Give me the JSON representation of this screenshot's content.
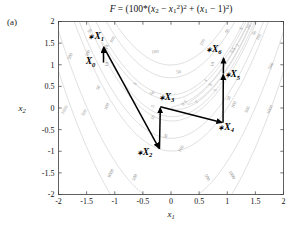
{
  "figure": {
    "panel_label": "(a)",
    "title_parts": {
      "f": "F",
      "eq": " = (100*(",
      "x2": "x",
      "x2sub": "2",
      "minus": " − ",
      "x1": "x",
      "x1sub": "1",
      "sq": "2",
      "close1": ")",
      "sq2": "2",
      "plus": " + (",
      "x1b": "x",
      "x1bsub": "1",
      "minus1": " − 1)",
      "sq3": "2",
      "close2": ")"
    },
    "xlabel": "x",
    "xlabel_sub": "1",
    "ylabel": "x",
    "ylabel_sub": "2"
  },
  "chart_data": {
    "type": "line",
    "xlabel": "x1",
    "ylabel": "x2",
    "xlim": [
      -2,
      2
    ],
    "ylim": [
      -2,
      2
    ],
    "grid": false,
    "xticks": [
      "-2",
      "-1.5",
      "-1",
      "-0.5",
      "0",
      "0.5",
      "1",
      "1.5",
      "2"
    ],
    "xtick_values": [
      -2,
      -1.5,
      -1,
      -0.5,
      0,
      0.5,
      1,
      1.5,
      2
    ],
    "yticks": [
      "-2",
      "-1.5",
      "-1",
      "-0.5",
      "0",
      "0.5",
      "1",
      "1.5",
      "2"
    ],
    "ytick_values": [
      -2,
      -1.5,
      -1,
      -0.5,
      0,
      0.5,
      1,
      1.5,
      2
    ],
    "contour_levels": [
      0.5,
      1,
      5,
      10,
      50,
      100,
      500,
      1000
    ],
    "function": "Rosenbrock",
    "series": [
      {
        "name": "search-path",
        "points": [
          {
            "label": "X0",
            "x": -1.2,
            "y": 1.05
          },
          {
            "label": "X1",
            "x": -1.2,
            "y": 1.42
          },
          {
            "label": "X2",
            "x": -0.205,
            "y": -0.95
          },
          {
            "label": "X3",
            "x": -0.19,
            "y": 0.03
          },
          {
            "label": "X4",
            "x": 0.925,
            "y": -0.34
          },
          {
            "label": "X5",
            "x": 0.93,
            "y": 0.8
          },
          {
            "label": "X6",
            "x": 0.935,
            "y": 1.18
          }
        ]
      }
    ],
    "point_labels": [
      {
        "text": "X",
        "sub": "0",
        "star": false,
        "x": -1.43,
        "y": 1.01
      },
      {
        "text": "X",
        "sub": "1",
        "star": true,
        "x": -1.33,
        "y": 1.6
      },
      {
        "text": "X",
        "sub": "2",
        "star": true,
        "x": -0.47,
        "y": -1.08
      },
      {
        "text": "X",
        "sub": "3",
        "star": true,
        "x": -0.08,
        "y": 0.19
      },
      {
        "text": "X",
        "sub": "4",
        "star": true,
        "x": 0.98,
        "y": -0.5
      },
      {
        "text": "X",
        "sub": "5",
        "star": true,
        "x": 1.09,
        "y": 0.71
      },
      {
        "text": "X",
        "sub": "6",
        "star": true,
        "x": 0.76,
        "y": 1.3
      }
    ],
    "contour_labels": [
      {
        "text": "500",
        "x": -1.77,
        "y": 1.18,
        "rot": -62
      },
      {
        "text": "100",
        "x": -1.46,
        "y": 1.25,
        "rot": -62
      },
      {
        "text": "1000",
        "x": -1.87,
        "y": -0.06,
        "rot": -60
      },
      {
        "text": "500",
        "x": -1.52,
        "y": -0.12,
        "rot": -60
      },
      {
        "text": "50",
        "x": -1.42,
        "y": 1.76,
        "rot": -55
      },
      {
        "text": "50",
        "x": -1.27,
        "y": 0.45,
        "rot": -62
      },
      {
        "text": "100",
        "x": -1.12,
        "y": 0.02,
        "rot": -62
      },
      {
        "text": "100",
        "x": -1.02,
        "y": 1.56,
        "rot": -55
      },
      {
        "text": "10",
        "x": -1.12,
        "y": 1.4,
        "rot": -70
      },
      {
        "text": "10",
        "x": -1.12,
        "y": 1.0,
        "rot": -70
      },
      {
        "text": "100",
        "x": -0.28,
        "y": 1.27,
        "rot": -6
      },
      {
        "text": "50",
        "x": 0.14,
        "y": 0.8,
        "rot": -10
      },
      {
        "text": "5",
        "x": -0.62,
        "y": 0.54,
        "rot": -55
      },
      {
        "text": "10",
        "x": -0.33,
        "y": 0.31,
        "rot": -24
      },
      {
        "text": "5",
        "x": -0.3,
        "y": 0.02,
        "rot": -60
      },
      {
        "text": "10",
        "x": -0.3,
        "y": -0.24,
        "rot": -60
      },
      {
        "text": "50",
        "x": -0.07,
        "y": -0.67,
        "rot": -62
      },
      {
        "text": "100",
        "x": 0.2,
        "y": -0.96,
        "rot": -55
      },
      {
        "text": "1000",
        "x": -1.05,
        "y": -1.53,
        "rot": -63
      },
      {
        "text": "500",
        "x": -0.62,
        "y": -1.62,
        "rot": -63
      },
      {
        "text": "0.5",
        "x": 0.25,
        "y": 0.09,
        "rot": -42
      },
      {
        "text": "1",
        "x": 0.47,
        "y": 0.12,
        "rot": -42
      },
      {
        "text": "5",
        "x": 0.72,
        "y": 0.52,
        "rot": -55
      },
      {
        "text": "1",
        "x": 0.64,
        "y": 0.62,
        "rot": -55
      },
      {
        "text": "5",
        "x": 0.81,
        "y": 0.4,
        "rot": -65
      },
      {
        "text": "10",
        "x": 0.76,
        "y": 1.0,
        "rot": -70
      },
      {
        "text": "50",
        "x": 1.05,
        "y": 0.21,
        "rot": -62
      },
      {
        "text": "100",
        "x": 1.14,
        "y": 0.06,
        "rot": -62
      },
      {
        "text": "100",
        "x": 0.58,
        "y": 1.5,
        "rot": -58
      },
      {
        "text": "50",
        "x": 1.02,
        "y": 1.76,
        "rot": -58
      },
      {
        "text": "0.5",
        "x": 1.12,
        "y": 1.32,
        "rot": -58
      },
      {
        "text": "1",
        "x": 1.2,
        "y": 1.44,
        "rot": -58
      },
      {
        "text": "5",
        "x": 1.27,
        "y": 1.82,
        "rot": -58
      },
      {
        "text": "10",
        "x": 1.4,
        "y": 1.86,
        "rot": -58
      },
      {
        "text": "50",
        "x": 1.5,
        "y": 1.72,
        "rot": -58
      },
      {
        "text": "100",
        "x": 1.58,
        "y": 1.62,
        "rot": -58
      },
      {
        "text": "500",
        "x": 1.8,
        "y": 0.96,
        "rot": -66
      },
      {
        "text": "1000",
        "x": 1.78,
        "y": -0.05,
        "rot": -64
      },
      {
        "text": "500",
        "x": 1.38,
        "y": -0.05,
        "rot": -64
      },
      {
        "text": "500",
        "x": 0.62,
        "y": -1.62,
        "rot": 62
      },
      {
        "text": "1000",
        "x": 1.06,
        "y": -1.56,
        "rot": 62
      }
    ],
    "colors": {
      "contour": "#bdbdbd",
      "path": "#000000",
      "axis": "#3a3a3a",
      "background": "#ffffff"
    }
  }
}
